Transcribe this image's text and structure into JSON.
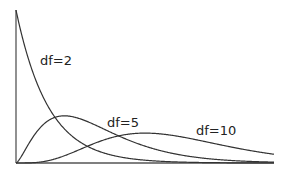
{
  "chart_data": {
    "type": "line",
    "title": "",
    "xlabel": "",
    "ylabel": "",
    "xlim": [
      0,
      16
    ],
    "ylim": [
      0,
      0.5
    ],
    "grid": false,
    "legend": "inline labels",
    "series": [
      {
        "name": "df=2",
        "df": 2,
        "label": "df=2"
      },
      {
        "name": "df=5",
        "df": 5,
        "label": "df=5"
      },
      {
        "name": "df=10",
        "df": 10,
        "label": "df=10"
      }
    ],
    "x": [
      0,
      1,
      2,
      3,
      4,
      5,
      6,
      7,
      8,
      9,
      10,
      11,
      12,
      13,
      14,
      15,
      16
    ],
    "values_by_series": {
      "df=2": [
        0.5,
        0.303,
        0.184,
        0.112,
        0.068,
        0.041,
        0.025,
        0.015,
        0.009,
        0.006,
        0.003,
        0.002,
        0.001,
        0.001,
        0.0005,
        0.0003,
        0.0002
      ],
      "df=5": [
        0.0,
        0.08,
        0.138,
        0.154,
        0.144,
        0.122,
        0.096,
        0.072,
        0.052,
        0.036,
        0.025,
        0.016,
        0.011,
        0.007,
        0.004,
        0.003,
        0.002
      ],
      "df=10": [
        0.0,
        0.001,
        0.008,
        0.025,
        0.045,
        0.067,
        0.081,
        0.092,
        0.098,
        0.097,
        0.088,
        0.078,
        0.067,
        0.055,
        0.044,
        0.035,
        0.027
      ]
    }
  },
  "labels": {
    "df2": "df=2",
    "df5": "df=5",
    "df10": "df=10"
  }
}
